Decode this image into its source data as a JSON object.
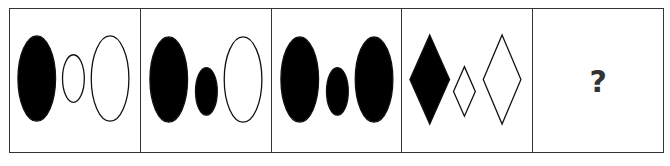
{
  "puzzle": {
    "panels": [
      {
        "id": 1,
        "shapes": [
          {
            "type": "ellipse",
            "fill": "black",
            "cx": 27,
            "cy": 69,
            "rx": 19,
            "ry": 43
          },
          {
            "type": "ellipse",
            "fill": "white",
            "cx": 64,
            "cy": 69,
            "rx": 11,
            "ry": 24
          },
          {
            "type": "ellipse",
            "fill": "white",
            "cx": 101,
            "cy": 69,
            "rx": 19,
            "ry": 43
          }
        ]
      },
      {
        "id": 2,
        "shapes": [
          {
            "type": "ellipse",
            "fill": "black",
            "cx": 28,
            "cy": 70,
            "rx": 19,
            "ry": 43
          },
          {
            "type": "ellipse",
            "fill": "black",
            "cx": 66,
            "cy": 82,
            "rx": 11,
            "ry": 24
          },
          {
            "type": "ellipse",
            "fill": "white",
            "cx": 103,
            "cy": 70,
            "rx": 19,
            "ry": 43
          }
        ]
      },
      {
        "id": 3,
        "shapes": [
          {
            "type": "ellipse",
            "fill": "black",
            "cx": 28,
            "cy": 70,
            "rx": 19,
            "ry": 43
          },
          {
            "type": "ellipse",
            "fill": "black",
            "cx": 66,
            "cy": 82,
            "rx": 11,
            "ry": 24
          },
          {
            "type": "ellipse",
            "fill": "black",
            "cx": 103,
            "cy": 70,
            "rx": 19,
            "ry": 43
          }
        ]
      },
      {
        "id": 4,
        "shapes": [
          {
            "type": "diamond",
            "fill": "black",
            "cx": 28,
            "cy": 70,
            "w": 40,
            "h": 90
          },
          {
            "type": "diamond",
            "fill": "white",
            "cx": 63,
            "cy": 82,
            "w": 22,
            "h": 50
          },
          {
            "type": "diamond",
            "fill": "white",
            "cx": 101,
            "cy": 70,
            "w": 38,
            "h": 90
          }
        ]
      },
      {
        "id": 5,
        "question_mark": "?"
      }
    ]
  }
}
